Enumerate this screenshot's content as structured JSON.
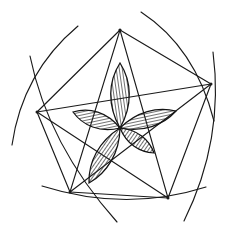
{
  "figure": {
    "canvas": {
      "width": 232,
      "height": 237,
      "background_color": "#ffffff"
    },
    "ink_color": "#1a1a1a",
    "hatch_color": "#262626",
    "center": {
      "x": 120,
      "y": 128
    }
  },
  "chart_data": {
    "type": "diagram",
    "pentagon_vertices": [
      {
        "name": "top",
        "x": 120,
        "y": 30
      },
      {
        "name": "right",
        "x": 211,
        "y": 84
      },
      {
        "name": "bottom-right",
        "x": 168,
        "y": 198
      },
      {
        "name": "bottom-left",
        "x": 70,
        "y": 192
      },
      {
        "name": "left",
        "x": 37,
        "y": 112
      }
    ],
    "pentagon_edges": [
      {
        "from": "top",
        "to": "right"
      },
      {
        "from": "right",
        "to": "bottom-right"
      },
      {
        "from": "bottom-right",
        "to": "bottom-left"
      },
      {
        "from": "bottom-left",
        "to": "left"
      },
      {
        "from": "left",
        "to": "top"
      }
    ],
    "pentagram_chords": [
      {
        "from": "top",
        "to": "bottom-right"
      },
      {
        "from": "top",
        "to": "bottom-left"
      },
      {
        "from": "right",
        "to": "bottom-left"
      },
      {
        "from": "right",
        "to": "left"
      },
      {
        "from": "bottom-right",
        "to": "left"
      }
    ],
    "petals": [
      {
        "name": "petal-top",
        "tip_x": 120,
        "tip_y": 63,
        "width": 13,
        "hatched": true
      },
      {
        "name": "petal-upper-right",
        "tip_x": 176,
        "tip_y": 111,
        "width": 11,
        "hatched": true
      },
      {
        "name": "petal-upper-left",
        "tip_x": 73,
        "tip_y": 112,
        "width": 11,
        "hatched": true
      },
      {
        "name": "petal-lower-left",
        "tip_x": 89,
        "tip_y": 183,
        "width": 12,
        "hatched": true
      },
      {
        "name": "petal-lower-right",
        "tip_x": 154,
        "tip_y": 153,
        "width": 9,
        "hatched": true
      }
    ],
    "arcs": [
      {
        "name": "arc-top-left",
        "start_x": 78,
        "start_y": 26,
        "end_x": 12,
        "end_y": 145
      },
      {
        "name": "arc-top-right",
        "start_x": 141,
        "start_y": 12,
        "end_x": 214,
        "end_y": 121
      },
      {
        "name": "arc-right",
        "start_x": 213,
        "start_y": 52,
        "end_x": 184,
        "end_y": 221
      },
      {
        "name": "arc-bottom",
        "start_x": 42,
        "start_y": 186,
        "end_x": 206,
        "end_y": 187
      },
      {
        "name": "arc-left-bottom",
        "start_x": 30,
        "start_y": 56,
        "end_x": 117,
        "end_y": 222
      }
    ],
    "counts": {
      "vertices": 5,
      "edges": 5,
      "chords": 5,
      "petals": 5,
      "arcs": 5
    }
  }
}
